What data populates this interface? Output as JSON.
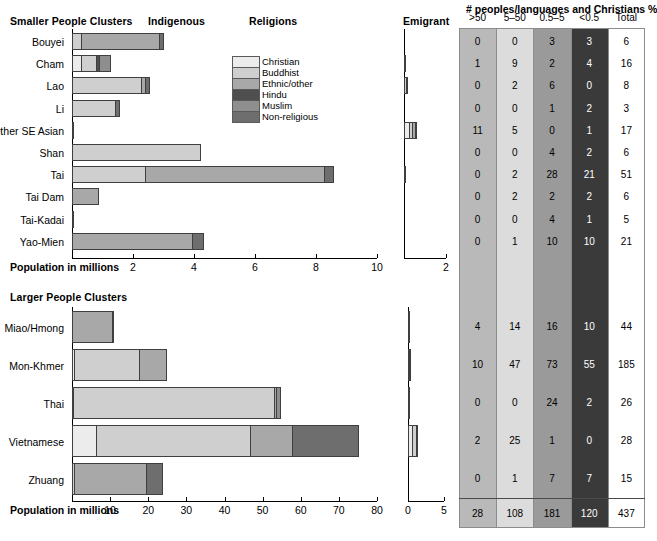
{
  "titles": {
    "smaller_clusters": "Smaller People Clusters",
    "larger_clusters": "Larger People Clusters",
    "indigenous": "Indigenous",
    "religions": "Religions",
    "emigrant": "Emigrant",
    "axis_title": "Population in millions",
    "table_title": "# peoples/languages and Christians %"
  },
  "legend": {
    "items": [
      {
        "label": "Christian",
        "color": "#ececec"
      },
      {
        "label": "Buddhist",
        "color": "#cfcfcf"
      },
      {
        "label": "Ethnic/other",
        "color": "#a8a8a8"
      },
      {
        "label": "Hindu",
        "color": "#4f4f4f"
      },
      {
        "label": "Muslim",
        "color": "#8e8e8e"
      },
      {
        "label": "Non-religious",
        "color": "#6e6e6e"
      }
    ]
  },
  "table": {
    "columns": [
      ">50",
      "5–50",
      "0.5–5",
      "<0.5",
      "Total"
    ],
    "column_colors": [
      "#b9b9b9",
      "#dcdcdc",
      "#9a9a9a",
      "#3a3a3a",
      "#ffffff"
    ],
    "top_rows": [
      {
        "name": "Bouyei",
        "values": [
          "0",
          "0",
          "3",
          "3",
          "6"
        ]
      },
      {
        "name": "Cham",
        "values": [
          "1",
          "9",
          "2",
          "4",
          "16"
        ]
      },
      {
        "name": "Lao",
        "values": [
          "0",
          "2",
          "6",
          "0",
          "8"
        ]
      },
      {
        "name": "Li",
        "values": [
          "0",
          "0",
          "1",
          "2",
          "3"
        ]
      },
      {
        "name": "Other SE Asian",
        "values": [
          "11",
          "5",
          "0",
          "1",
          "17"
        ]
      },
      {
        "name": "Shan",
        "values": [
          "0",
          "0",
          "4",
          "2",
          "6"
        ]
      },
      {
        "name": "Tai",
        "values": [
          "0",
          "2",
          "28",
          "21",
          "51"
        ]
      },
      {
        "name": "Tai Dam",
        "values": [
          "0",
          "2",
          "2",
          "2",
          "6"
        ]
      },
      {
        "name": "Tai-Kadai",
        "values": [
          "0",
          "0",
          "4",
          "1",
          "5"
        ]
      },
      {
        "name": "Yao-Mien",
        "values": [
          "0",
          "1",
          "10",
          "10",
          "21"
        ]
      }
    ],
    "bottom_rows": [
      {
        "name": "Miao/Hmong",
        "values": [
          "4",
          "14",
          "16",
          "10",
          "44"
        ]
      },
      {
        "name": "Mon-Khmer",
        "values": [
          "10",
          "47",
          "73",
          "55",
          "185"
        ]
      },
      {
        "name": "Thai",
        "values": [
          "0",
          "0",
          "24",
          "2",
          "26"
        ]
      },
      {
        "name": "Vietnamese",
        "values": [
          "2",
          "25",
          "1",
          "0",
          "28"
        ]
      },
      {
        "name": "Zhuang",
        "values": [
          "0",
          "1",
          "7",
          "7",
          "15"
        ]
      }
    ],
    "totals": [
      "28",
      "108",
      "181",
      "120",
      "437"
    ]
  },
  "chart_data": [
    {
      "type": "bar",
      "id": "smaller-indigenous",
      "title": "Smaller People Clusters — Indigenous",
      "xlabel": "Population in millions",
      "xlim": [
        0,
        10
      ],
      "ticks": [
        2,
        4,
        6,
        8,
        10
      ],
      "stacked": true,
      "series_order": [
        "Christian",
        "Buddhist",
        "Ethnic/other",
        "Hindu",
        "Muslim",
        "Non-religious"
      ],
      "categories": [
        "Bouyei",
        "Cham",
        "Lao",
        "Li",
        "Other SE Asian",
        "Shan",
        "Tai",
        "Tai Dam",
        "Tai-Kadai",
        "Yao-Mien"
      ],
      "rows": [
        {
          "category": "Bouyei",
          "segments": [
            {
              "r": "Buddhist",
              "v": 0.3
            },
            {
              "r": "Ethnic/other",
              "v": 2.55
            },
            {
              "r": "Non-religious",
              "v": 0.16
            }
          ]
        },
        {
          "category": "Cham",
          "segments": [
            {
              "r": "Christian",
              "v": 0.3
            },
            {
              "r": "Buddhist",
              "v": 0.48
            },
            {
              "r": "Hindu",
              "v": 0.11
            },
            {
              "r": "Muslim",
              "v": 0.38
            }
          ]
        },
        {
          "category": "Lao",
          "segments": [
            {
              "r": "Buddhist",
              "v": 2.27
            },
            {
              "r": "Ethnic/other",
              "v": 0.12
            },
            {
              "r": "Non-religious",
              "v": 0.17
            }
          ]
        },
        {
          "category": "Li",
          "segments": [
            {
              "r": "Buddhist",
              "v": 1.42
            },
            {
              "r": "Non-religious",
              "v": 0.14
            }
          ]
        },
        {
          "category": "Other SE Asian",
          "segments": [
            {
              "r": "Ethnic/other",
              "v": 0.06
            }
          ]
        },
        {
          "category": "Shan",
          "segments": [
            {
              "r": "Buddhist",
              "v": 4.23
            }
          ]
        },
        {
          "category": "Tai",
          "segments": [
            {
              "r": "Buddhist",
              "v": 2.4
            },
            {
              "r": "Ethnic/other",
              "v": 5.85
            },
            {
              "r": "Non-religious",
              "v": 0.33
            }
          ]
        },
        {
          "category": "Tai Dam",
          "segments": [
            {
              "r": "Ethnic/other",
              "v": 0.9
            }
          ]
        },
        {
          "category": "Tai-Kadai",
          "segments": [
            {
              "r": "Ethnic/other",
              "v": 0.05
            }
          ]
        },
        {
          "category": "Yao-Mien",
          "segments": [
            {
              "r": "Ethnic/other",
              "v": 3.95
            },
            {
              "r": "Non-religious",
              "v": 0.37
            }
          ]
        }
      ]
    },
    {
      "type": "bar",
      "id": "smaller-emigrant",
      "title": "Smaller People Clusters — Emigrant",
      "xlim": [
        0,
        2
      ],
      "ticks": [
        2
      ],
      "stacked": true,
      "categories": [
        "Bouyei",
        "Cham",
        "Lao",
        "Li",
        "Other SE Asian",
        "Shan",
        "Tai",
        "Tai Dam",
        "Tai-Kadai",
        "Yao-Mien"
      ],
      "rows": [
        {
          "category": "Bouyei",
          "segments": []
        },
        {
          "category": "Cham",
          "segments": [
            {
              "r": "Ethnic/other",
              "v": 0.03
            }
          ]
        },
        {
          "category": "Lao",
          "segments": [
            {
              "r": "Buddhist",
              "v": 0.1
            },
            {
              "r": "Ethnic/other",
              "v": 0.06
            }
          ]
        },
        {
          "category": "Li",
          "segments": []
        },
        {
          "category": "Other SE Asian",
          "segments": [
            {
              "r": "Christian",
              "v": 0.26
            },
            {
              "r": "Buddhist",
              "v": 0.12
            },
            {
              "r": "Ethnic/other",
              "v": 0.15
            },
            {
              "r": "Hindu",
              "v": 0.05
            }
          ]
        },
        {
          "category": "Shan",
          "segments": []
        },
        {
          "category": "Tai",
          "segments": [
            {
              "r": "Non-religious",
              "v": 0.04
            }
          ]
        },
        {
          "category": "Tai Dam",
          "segments": []
        },
        {
          "category": "Tai-Kadai",
          "segments": []
        },
        {
          "category": "Yao-Mien",
          "segments": []
        }
      ]
    },
    {
      "type": "bar",
      "id": "larger-indigenous",
      "title": "Larger People Clusters — Indigenous",
      "xlabel": "Population in millions",
      "xlim": [
        0,
        80
      ],
      "ticks": [
        10,
        20,
        30,
        40,
        50,
        60,
        70,
        80
      ],
      "stacked": true,
      "categories": [
        "Miao/Hmong",
        "Mon-Khmer",
        "Thai",
        "Vietnamese",
        "Zhuang"
      ],
      "rows": [
        {
          "category": "Miao/Hmong",
          "segments": [
            {
              "r": "Ethnic/other",
              "v": 10.4
            },
            {
              "r": "Non-religious",
              "v": 0.6
            }
          ]
        },
        {
          "category": "Mon-Khmer",
          "segments": [
            {
              "r": "Christian",
              "v": 0.5
            },
            {
              "r": "Buddhist",
              "v": 17.0
            },
            {
              "r": "Ethnic/other",
              "v": 7.4
            }
          ]
        },
        {
          "category": "Thai",
          "segments": [
            {
              "r": "Christian",
              "v": 0.3
            },
            {
              "r": "Buddhist",
              "v": 52.6
            },
            {
              "r": "Ethnic/other",
              "v": 0.6
            },
            {
              "r": "Muslim",
              "v": 1.4
            }
          ]
        },
        {
          "category": "Vietnamese",
          "segments": [
            {
              "r": "Christian",
              "v": 6.2
            },
            {
              "r": "Buddhist",
              "v": 40.5
            },
            {
              "r": "Ethnic/other",
              "v": 11.0
            },
            {
              "r": "Non-religious",
              "v": 17.7
            }
          ]
        },
        {
          "category": "Zhuang",
          "segments": [
            {
              "r": "Buddhist",
              "v": 0.4
            },
            {
              "r": "Ethnic/other",
              "v": 19.0
            },
            {
              "r": "Non-religious",
              "v": 4.6
            }
          ]
        }
      ]
    },
    {
      "type": "bar",
      "id": "larger-emigrant",
      "title": "Larger People Clusters — Emigrant",
      "xlim": [
        0,
        5
      ],
      "ticks": [
        0,
        5
      ],
      "stacked": true,
      "categories": [
        "Miao/Hmong",
        "Mon-Khmer",
        "Thai",
        "Vietnamese",
        "Zhuang"
      ],
      "rows": [
        {
          "category": "Miao/Hmong",
          "segments": [
            {
              "r": "Ethnic/other",
              "v": 0.08
            }
          ]
        },
        {
          "category": "Mon-Khmer",
          "segments": [
            {
              "r": "Christian",
              "v": 0.1
            },
            {
              "r": "Buddhist",
              "v": 0.12
            }
          ]
        },
        {
          "category": "Thai",
          "segments": [
            {
              "r": "Buddhist",
              "v": 0.06
            }
          ]
        },
        {
          "category": "Vietnamese",
          "segments": [
            {
              "r": "Christian",
              "v": 0.55
            },
            {
              "r": "Buddhist",
              "v": 0.55
            },
            {
              "r": "Non-religious",
              "v": 0.18
            }
          ]
        },
        {
          "category": "Zhuang",
          "segments": []
        }
      ]
    }
  ]
}
